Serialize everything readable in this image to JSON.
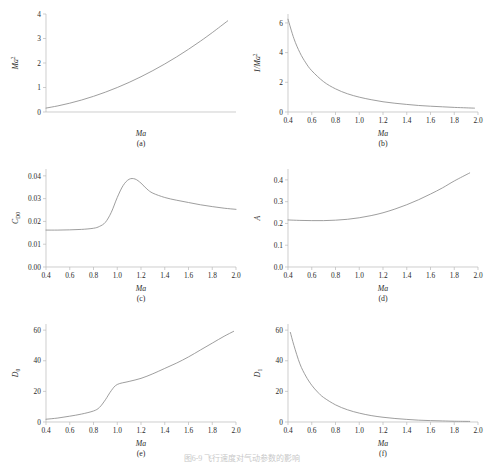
{
  "figure": {
    "caption": "图6-9  飞行速度对气动参数的影响",
    "panels": [
      {
        "tag": "(a)",
        "xlabel": "Ma",
        "ylabel": "Ma",
        "ylabel_sup": "2",
        "ylabel_sub": ""
      },
      {
        "tag": "(b)",
        "xlabel": "Ma",
        "ylabel": "1/Ma",
        "ylabel_sup": "2",
        "ylabel_sub": ""
      },
      {
        "tag": "(c)",
        "xlabel": "Ma",
        "ylabel": "C",
        "ylabel_sup": "",
        "ylabel_sub": "D0"
      },
      {
        "tag": "(d)",
        "xlabel": "Ma",
        "ylabel": "A",
        "ylabel_sup": "",
        "ylabel_sub": ""
      },
      {
        "tag": "(e)",
        "xlabel": "Ma",
        "ylabel": "D",
        "ylabel_sup": "",
        "ylabel_sub": "0"
      },
      {
        "tag": "(f)",
        "xlabel": "Ma",
        "ylabel": "D",
        "ylabel_sup": "",
        "ylabel_sub": "1"
      }
    ]
  },
  "style": {
    "curve_color": "#8d8d8d",
    "axis_color": "#b9b9b9",
    "text_color": "#2a2a2a",
    "background": "#ffffff"
  },
  "chart_data": [
    {
      "id": "a",
      "type": "line",
      "title": "",
      "panel_tag": "(a)",
      "xlabel": "Ma",
      "ylabel": "Ma^2",
      "xlim": [
        0.4,
        2.0
      ],
      "ylim": [
        0,
        4
      ],
      "xticks": [],
      "xticklabels": [],
      "yticks": [
        0,
        1,
        2,
        3,
        4
      ],
      "yticklabels": [
        "0",
        "1",
        "2",
        "3",
        "4"
      ],
      "grid": false,
      "legend": "none",
      "x": [
        0.4,
        0.5,
        0.6,
        0.7,
        0.8,
        0.9,
        1.0,
        1.1,
        1.2,
        1.3,
        1.4,
        1.5,
        1.6,
        1.7,
        1.8,
        1.93
      ],
      "values": [
        0.16,
        0.25,
        0.36,
        0.49,
        0.64,
        0.81,
        1.0,
        1.21,
        1.44,
        1.69,
        1.96,
        2.25,
        2.56,
        2.89,
        3.24,
        3.72
      ]
    },
    {
      "id": "b",
      "type": "line",
      "title": "",
      "panel_tag": "(b)",
      "xlabel": "Ma",
      "ylabel": "1/Ma^2",
      "xlim": [
        0.4,
        2.0
      ],
      "ylim": [
        0,
        6.6
      ],
      "xticks": [
        0.4,
        0.6,
        0.8,
        1.0,
        1.2,
        1.4,
        1.6,
        1.8,
        2.0
      ],
      "xticklabels": [
        "0.4",
        "0.6",
        "0.8",
        "1.0",
        "1.2",
        "1.4",
        "1.6",
        "1.8",
        "2.0"
      ],
      "yticks": [
        0,
        2,
        4,
        6
      ],
      "yticklabels": [
        "0",
        "2",
        "4",
        "6"
      ],
      "grid": false,
      "legend": "none",
      "x": [
        0.4,
        0.45,
        0.5,
        0.55,
        0.6,
        0.7,
        0.8,
        0.9,
        1.0,
        1.1,
        1.2,
        1.3,
        1.4,
        1.5,
        1.6,
        1.7,
        1.8,
        1.9,
        1.97
      ],
      "values": [
        6.25,
        4.94,
        4.0,
        3.31,
        2.78,
        2.04,
        1.56,
        1.23,
        1.0,
        0.83,
        0.69,
        0.59,
        0.51,
        0.44,
        0.39,
        0.35,
        0.31,
        0.28,
        0.26
      ]
    },
    {
      "id": "c",
      "type": "line",
      "title": "",
      "panel_tag": "(c)",
      "xlabel": "Ma",
      "ylabel": "C_D0",
      "xlim": [
        0.4,
        2.0
      ],
      "ylim": [
        0.0,
        0.043
      ],
      "xticks": [
        0.4,
        0.6,
        0.8,
        1.0,
        1.2,
        1.4,
        1.6,
        1.8,
        2.0
      ],
      "xticklabels": [
        "0.4",
        "0.6",
        "0.8",
        "1.0",
        "1.2",
        "1.4",
        "1.6",
        "1.8",
        "2.0"
      ],
      "yticks": [
        0.0,
        0.01,
        0.02,
        0.03,
        0.04
      ],
      "yticklabels": [
        "0.00",
        "0.01",
        "0.02",
        "0.03",
        "0.04"
      ],
      "grid": false,
      "legend": "none",
      "x": [
        0.4,
        0.5,
        0.6,
        0.7,
        0.8,
        0.85,
        0.9,
        0.95,
        1.0,
        1.05,
        1.1,
        1.15,
        1.2,
        1.25,
        1.3,
        1.4,
        1.5,
        1.6,
        1.7,
        1.8,
        1.9,
        2.0
      ],
      "values": [
        0.0162,
        0.0162,
        0.0163,
        0.0165,
        0.017,
        0.0178,
        0.0196,
        0.024,
        0.0305,
        0.0358,
        0.0385,
        0.0386,
        0.0368,
        0.0342,
        0.0324,
        0.0305,
        0.0293,
        0.0283,
        0.0273,
        0.0265,
        0.0258,
        0.0253
      ]
    },
    {
      "id": "d",
      "type": "line",
      "title": "",
      "panel_tag": "(d)",
      "xlabel": "Ma",
      "ylabel": "A",
      "xlim": [
        0.4,
        2.0
      ],
      "ylim": [
        0.0,
        0.45
      ],
      "xticks": [
        0.4,
        0.6,
        0.8,
        1.0,
        1.2,
        1.4,
        1.6,
        1.8,
        2.0
      ],
      "xticklabels": [
        "0.4",
        "0.6",
        "0.8",
        "1.0",
        "1.2",
        "1.4",
        "1.6",
        "1.8",
        "2.0"
      ],
      "yticks": [
        0.0,
        0.1,
        0.2,
        0.3,
        0.4
      ],
      "yticklabels": [
        "0.0",
        "0.1",
        "0.2",
        "0.3",
        "0.4"
      ],
      "grid": false,
      "legend": "none",
      "x": [
        0.4,
        0.5,
        0.6,
        0.7,
        0.8,
        0.9,
        1.0,
        1.1,
        1.2,
        1.3,
        1.4,
        1.5,
        1.6,
        1.7,
        1.8,
        1.93
      ],
      "values": [
        0.216,
        0.214,
        0.213,
        0.213,
        0.215,
        0.219,
        0.226,
        0.236,
        0.249,
        0.266,
        0.286,
        0.309,
        0.335,
        0.363,
        0.395,
        0.432
      ]
    },
    {
      "id": "e",
      "type": "line",
      "title": "",
      "panel_tag": "(e)",
      "xlabel": "Ma",
      "ylabel": "D_0",
      "xlim": [
        0.4,
        2.0
      ],
      "ylim": [
        0,
        64
      ],
      "xticks": [
        0.4,
        0.6,
        0.8,
        1.0,
        1.2,
        1.4,
        1.6,
        1.8,
        2.0
      ],
      "xticklabels": [
        "0.4",
        "0.6",
        "0.8",
        "1.0",
        "1.2",
        "1.4",
        "1.6",
        "1.8",
        "2.0"
      ],
      "yticks": [
        0,
        20,
        40,
        60
      ],
      "yticklabels": [
        "0",
        "20",
        "40",
        "60"
      ],
      "grid": false,
      "legend": "none",
      "x": [
        0.4,
        0.5,
        0.6,
        0.7,
        0.8,
        0.85,
        0.9,
        0.95,
        1.0,
        1.1,
        1.2,
        1.3,
        1.4,
        1.5,
        1.6,
        1.7,
        1.8,
        1.9,
        1.98
      ],
      "values": [
        1.8,
        2.6,
        3.8,
        5.2,
        7.2,
        9.5,
        14.5,
        20.5,
        24.5,
        26.5,
        28.5,
        31.5,
        35.0,
        38.5,
        42.5,
        47.0,
        51.5,
        56.0,
        59.2
      ]
    },
    {
      "id": "f",
      "type": "line",
      "title": "",
      "panel_tag": "(f)",
      "xlabel": "Ma",
      "ylabel": "D_1",
      "xlim": [
        0.4,
        2.0
      ],
      "ylim": [
        0,
        64
      ],
      "xticks": [
        0.4,
        0.6,
        0.8,
        1.0,
        1.2,
        1.4,
        1.6,
        1.8,
        2.0
      ],
      "xticklabels": [
        "0.4",
        "0.6",
        "0.8",
        "1.0",
        "1.2",
        "1.4",
        "1.6",
        "1.8",
        "2.0"
      ],
      "yticks": [
        0,
        20,
        40,
        60
      ],
      "yticklabels": [
        "0",
        "20",
        "40",
        "60"
      ],
      "grid": false,
      "legend": "none",
      "x": [
        0.42,
        0.45,
        0.5,
        0.55,
        0.6,
        0.65,
        0.7,
        0.8,
        0.9,
        1.0,
        1.1,
        1.2,
        1.3,
        1.4,
        1.5,
        1.6,
        1.7,
        1.8,
        1.93
      ],
      "values": [
        58.5,
        50.0,
        38.0,
        30.0,
        24.0,
        19.5,
        16.0,
        11.2,
        8.0,
        5.8,
        4.2,
        3.1,
        2.3,
        1.7,
        1.2,
        0.9,
        0.7,
        0.5,
        0.4
      ]
    }
  ]
}
